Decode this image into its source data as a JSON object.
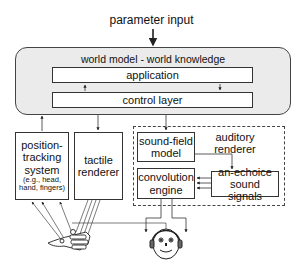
{
  "diagram": {
    "input_label": "parameter input",
    "world_model": {
      "label": "world model - world knowledge",
      "application": "application",
      "control_layer": "control layer"
    },
    "position_tracking": {
      "line1": "position-",
      "line2": "tracking",
      "line3": "system",
      "detail1": "(e.g., head,",
      "detail2": "hand, fingers)"
    },
    "tactile_renderer": {
      "line1": "tactile",
      "line2": "renderer"
    },
    "auditory_renderer": {
      "line1": "auditory",
      "line2": "renderer",
      "sound_field_model": {
        "line1": "sound-field",
        "line2": "model"
      },
      "convolution_engine": {
        "line1": "convolution",
        "line2": "engine"
      },
      "anechoic_signals": {
        "line1": "an-echoice",
        "line2": "sound signals"
      }
    },
    "figures": {
      "hand": "hand-with-sensors",
      "head": "listener-head-with-headphones"
    }
  }
}
